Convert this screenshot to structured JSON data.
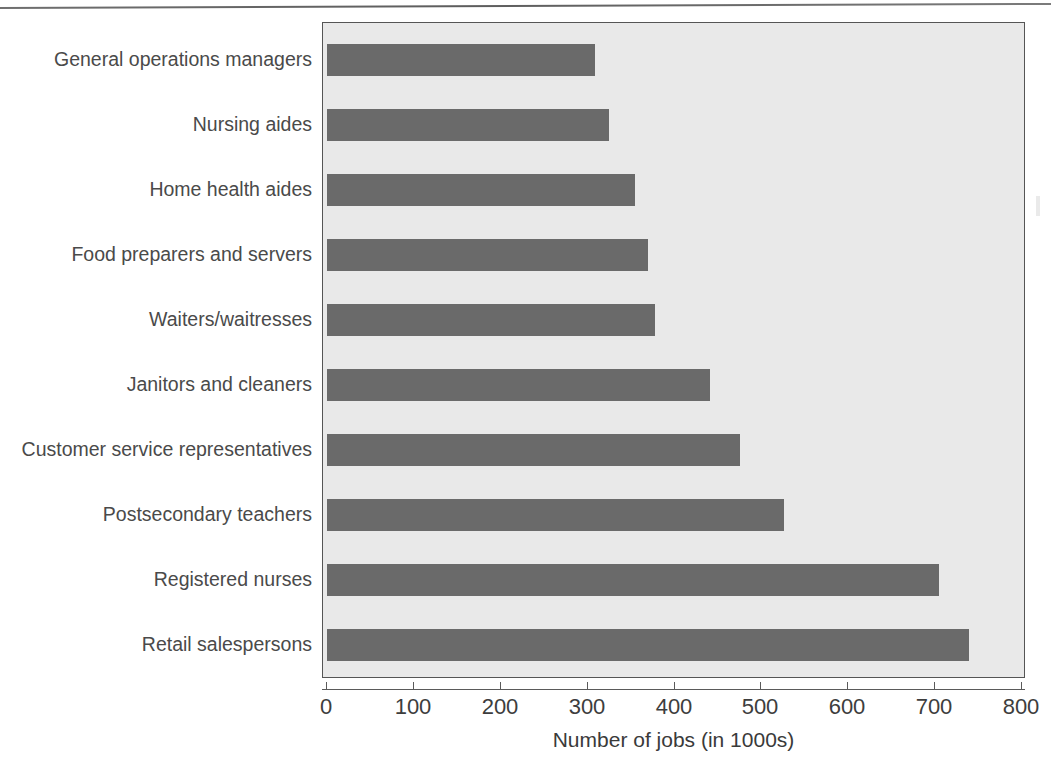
{
  "chart_data": {
    "type": "bar",
    "orientation": "horizontal",
    "title": "",
    "xlabel": "Number of jobs (in 1000s)",
    "ylabel": "",
    "xlim": [
      0,
      800
    ],
    "xticks": [
      0,
      100,
      200,
      300,
      400,
      500,
      600,
      700,
      800
    ],
    "xtick_labels": [
      "0",
      "100",
      "200",
      "300",
      "400",
      "500",
      "600",
      "700",
      "800"
    ],
    "grid": false,
    "legend": null,
    "categories": [
      "General operations managers",
      "Nursing aides",
      "Home health aides",
      "Food preparers and servers",
      "Waiters/waitresses",
      "Janitors and cleaners",
      "Customer service representatives",
      "Postsecondary teachers",
      "Registered nurses",
      "Retail salespersons"
    ],
    "values": [
      309,
      325,
      354,
      369,
      378,
      441,
      475,
      526,
      705,
      739
    ],
    "bar_color": "#6a6a6a",
    "plot_background": "#e9e9e9",
    "page_background": "#ffffff"
  }
}
